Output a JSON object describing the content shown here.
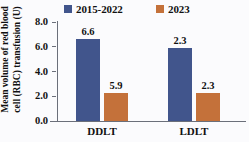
{
  "chart_data": {
    "type": "bar",
    "title": "",
    "xlabel": "",
    "ylabel": "Mean volume of red blood cell (RBC) transfusion (U)",
    "ylabel_lines": [
      "Mean volume of red blood",
      "cell (RBC) transfusion (U)"
    ],
    "categories": [
      "DDLT",
      "LDLT"
    ],
    "series": [
      {
        "name": "2015-2022",
        "values": [
          6.6,
          5.9
        ],
        "color": "#41558c"
      },
      {
        "name": "2023",
        "values": [
          2.3,
          2.3
        ],
        "color": "#c4713a"
      }
    ],
    "series_display": [
      {
        "name": "2015-2022",
        "color": "#41558c"
      },
      {
        "name": "2023",
        "color": "#c4713a"
      }
    ],
    "bars": [
      {
        "category": "DDLT",
        "series": "2015-2022",
        "value": 6.6,
        "label": "6.6",
        "color": "#41558c"
      },
      {
        "category": "DDLT",
        "series": "2023",
        "value": 5.9,
        "label": "5.9",
        "color": "#c4713a"
      },
      {
        "category": "LDLT",
        "series": "2015-2022",
        "value": 2.3,
        "label": "2.3",
        "color": "#41558c"
      },
      {
        "category": "LDLT",
        "series": "2023",
        "value": 2.3,
        "label": "2.3",
        "color": "#c4713a"
      }
    ],
    "ylim": [
      0.0,
      8.0
    ],
    "yticks": [
      0.0,
      2.0,
      4.0,
      6.0,
      8.0
    ],
    "ytick_labels": [
      "0.0",
      "2.0",
      "4.0",
      "6.0",
      "8.0"
    ],
    "grid": false,
    "legend_position": "top",
    "axis_color": "#6b6f7a",
    "background": "#fbfbfd"
  }
}
